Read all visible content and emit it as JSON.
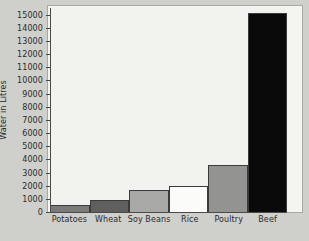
{
  "chart_data": {
    "type": "bar",
    "title": "",
    "xlabel": "",
    "ylabel": "Water in Litres",
    "categories": [
      "Potatoes",
      "Wheat",
      "Soy Beans",
      "Rice",
      "Poultry",
      "Beef"
    ],
    "values": [
      500,
      950,
      1650,
      1950,
      3600,
      15100
    ],
    "ylim": [
      0,
      15500
    ],
    "ytick_labels": [
      "0",
      "1000",
      "2000",
      "3000",
      "4000",
      "5000",
      "6000",
      "7000",
      "8000",
      "9000",
      "10000",
      "11000",
      "12000",
      "13000",
      "14000",
      "15000"
    ],
    "ytick_values": [
      0,
      1000,
      2000,
      3000,
      4000,
      5000,
      6000,
      7000,
      8000,
      9000,
      10000,
      11000,
      12000,
      13000,
      14000,
      15000
    ],
    "grid": false,
    "legend": false,
    "bar_colors": [
      "#7a7a78",
      "#5f5f5e",
      "#a8a8a6",
      "#fbfbf9",
      "#939391",
      "#0a0a0a"
    ],
    "bar_edge_color": "#3a3a3a",
    "plot_background": "#f2f2ee",
    "page_background": "#cfcfcb",
    "axis_color": "#4a4a4a",
    "text_color": "#2b2b2b"
  }
}
